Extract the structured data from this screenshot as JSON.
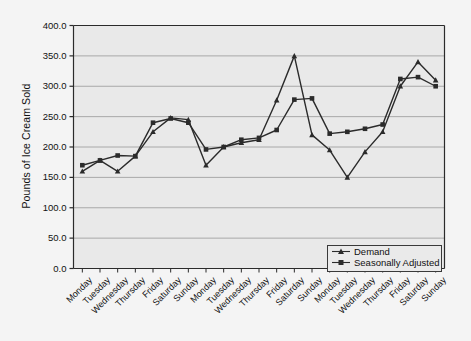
{
  "chart_data": {
    "type": "line",
    "title": "",
    "xlabel": "",
    "ylabel": "Pounds of Ice Cream Sold",
    "ylim": [
      0,
      400
    ],
    "ytick_labels": [
      "0.0",
      "50.0",
      "100.0",
      "150.0",
      "200.0",
      "250.0",
      "300.0",
      "350.0",
      "400.0"
    ],
    "ytick_values": [
      0,
      50,
      100,
      150,
      200,
      250,
      300,
      350,
      400
    ],
    "grid": true,
    "legend_position": "bottom-right",
    "categories": [
      "Monday",
      "Tuesday",
      "Wednesday",
      "Thursday",
      "Friday",
      "Saturday",
      "Sunday",
      "Monday",
      "Tuesday",
      "Wednesday",
      "Thursday",
      "Friday",
      "Saturday",
      "Sunday",
      "Monday",
      "Tuesday",
      "Wednesday",
      "Thursday",
      "Friday",
      "Saturday",
      "Sunday"
    ],
    "series": [
      {
        "name": "Demand",
        "marker": "triangle",
        "color": "#2b2b2b",
        "values": [
          160,
          178,
          160,
          185,
          225,
          248,
          245,
          170,
          200,
          207,
          212,
          277,
          350,
          220,
          195,
          150,
          192,
          225,
          300,
          340,
          310
        ]
      },
      {
        "name": "Seasonally Adjusted",
        "marker": "square",
        "color": "#2b2b2b",
        "values": [
          170,
          178,
          186,
          185,
          240,
          247,
          240,
          196,
          200,
          212,
          215,
          228,
          278,
          280,
          222,
          225,
          230,
          237,
          312,
          315,
          300
        ]
      }
    ]
  },
  "colors": {
    "plot_background": "#e9e9e9",
    "page_background": "#f4f4f4",
    "axis": "#2b2b2b",
    "gridline": "#a8a8a8",
    "series": "#2b2b2b"
  },
  "legend": {
    "items": [
      {
        "label": "Demand",
        "marker": "triangle"
      },
      {
        "label": "Seasonally Adjusted",
        "marker": "square"
      }
    ]
  }
}
